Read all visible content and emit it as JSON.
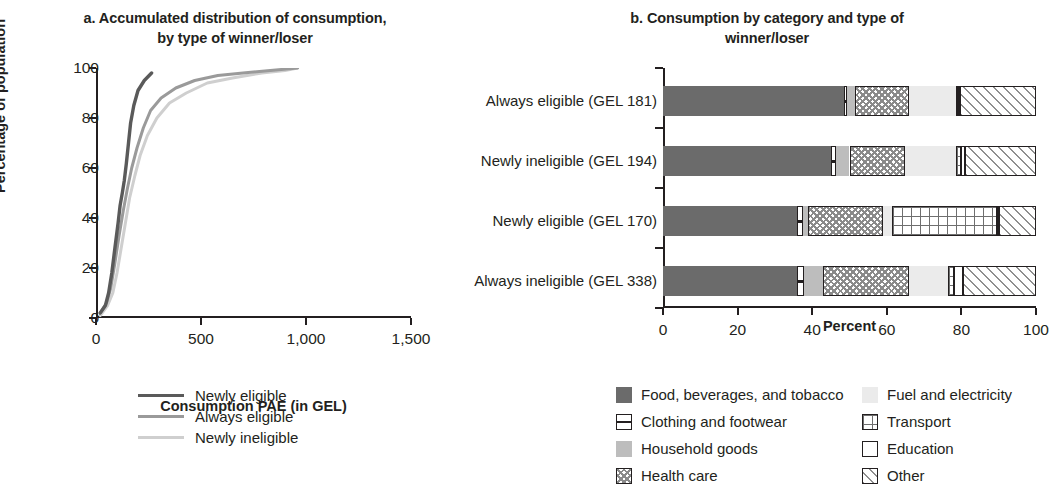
{
  "panel_a": {
    "title_line1": "a. Accumulated distribution of consumption,",
    "title_line2": "by type of winner/loser",
    "ylabel": "Percentage of population",
    "xlabel": "Consumption PAE (in GEL)",
    "yticks": [
      "0",
      "20",
      "40",
      "60",
      "80",
      "100"
    ],
    "xticks": [
      "0",
      "500",
      "1,000",
      "1,500"
    ],
    "legend": [
      {
        "label": "Newly eligible",
        "color": "#5a5a5a"
      },
      {
        "label": "Always eligible",
        "color": "#9a9a9a"
      },
      {
        "label": "Newly ineligible",
        "color": "#cfcfcf"
      }
    ]
  },
  "panel_b": {
    "title_line1": "b. Consumption by category and type of",
    "title_line2": "winner/loser",
    "xlabel": "Percent",
    "xticks": [
      "0",
      "20",
      "40",
      "60",
      "80",
      "100"
    ],
    "rows": [
      "Always eligible (GEL 181)",
      "Newly ineligible (GEL 194)",
      "Newly eligible (GEL 170)",
      "Always ineligible (GEL 338)"
    ],
    "legend": [
      {
        "label": "Food, beverages, and tobacco",
        "key": "food"
      },
      {
        "label": "Clothing and footwear",
        "key": "cloth"
      },
      {
        "label": "Household goods",
        "key": "house"
      },
      {
        "label": "Health care",
        "key": "health"
      },
      {
        "label": "Fuel and electricity",
        "key": "fuel"
      },
      {
        "label": "Transport",
        "key": "trans"
      },
      {
        "label": "Education",
        "key": "edu"
      },
      {
        "label": "Other",
        "key": "other"
      }
    ]
  },
  "chart_data": [
    {
      "type": "line",
      "title": "a. Accumulated distribution of consumption, by type of winner/loser",
      "xlabel": "Consumption PAE (in GEL)",
      "ylabel": "Percentage of population",
      "xlim": [
        0,
        1500
      ],
      "ylim": [
        0,
        100
      ],
      "xticks": [
        0,
        500,
        1000,
        1500
      ],
      "yticks": [
        0,
        20,
        40,
        60,
        80,
        100
      ],
      "grid": false,
      "legend_position": "below-center",
      "series": [
        {
          "name": "Newly eligible",
          "color": "#5a5a5a",
          "x": [
            20,
            45,
            60,
            75,
            90,
            105,
            115,
            125,
            135,
            145,
            155,
            165,
            180,
            200,
            230,
            265
          ],
          "y": [
            2,
            5,
            10,
            18,
            28,
            38,
            45,
            50,
            55,
            62,
            70,
            78,
            85,
            91,
            95,
            98
          ]
        },
        {
          "name": "Always eligible",
          "color": "#9a9a9a",
          "x": [
            20,
            50,
            70,
            90,
            110,
            130,
            150,
            170,
            195,
            225,
            260,
            310,
            380,
            470,
            580,
            700,
            830,
            960
          ],
          "y": [
            2,
            6,
            12,
            22,
            33,
            43,
            52,
            60,
            68,
            76,
            83,
            88,
            92,
            95,
            97,
            98,
            99,
            100
          ]
        },
        {
          "name": "Newly ineligible",
          "color": "#cfcfcf",
          "x": [
            20,
            55,
            80,
            100,
            120,
            140,
            160,
            185,
            210,
            245,
            290,
            350,
            430,
            530,
            650,
            790,
            900,
            960
          ],
          "y": [
            1,
            5,
            10,
            18,
            28,
            38,
            48,
            57,
            65,
            73,
            80,
            86,
            90,
            94,
            96,
            98,
            99,
            100
          ]
        }
      ]
    },
    {
      "type": "bar",
      "orientation": "horizontal",
      "stacked": true,
      "title": "b. Consumption by category and type of winner/loser",
      "xlabel": "Percent",
      "ylabel": "",
      "xlim": [
        0,
        100
      ],
      "xticks": [
        0,
        20,
        40,
        60,
        80,
        100
      ],
      "grid": false,
      "legend_position": "below",
      "categories": [
        "Always eligible (GEL 181)",
        "Newly ineligible (GEL 194)",
        "Newly eligible (GEL 170)",
        "Always ineligible (GEL 338)"
      ],
      "series": [
        {
          "name": "Food, beverages, and tobacco",
          "key": "food",
          "values": [
            48.5,
            45.0,
            36.0,
            36.0
          ]
        },
        {
          "name": "Clothing and footwear",
          "key": "cloth",
          "values": [
            0.8,
            1.5,
            1.5,
            1.8
          ]
        },
        {
          "name": "Household goods",
          "key": "house",
          "values": [
            2.2,
            3.5,
            1.5,
            5.2
          ]
        },
        {
          "name": "Health care",
          "key": "health",
          "values": [
            14.5,
            15.0,
            20.0,
            23.0
          ]
        },
        {
          "name": "Fuel and electricity",
          "key": "fuel",
          "values": [
            12.5,
            13.5,
            2.5,
            10.5
          ]
        },
        {
          "name": "Transport",
          "key": "trans",
          "values": [
            0.5,
            1.5,
            28.0,
            1.5
          ]
        },
        {
          "name": "Education",
          "key": "edu",
          "values": [
            0.5,
            1.0,
            0.5,
            2.5
          ]
        },
        {
          "name": "Other",
          "key": "other",
          "values": [
            20.5,
            19.0,
            10.0,
            19.5
          ]
        }
      ]
    }
  ]
}
